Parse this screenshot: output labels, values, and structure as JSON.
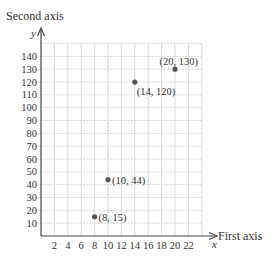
{
  "chart_data": {
    "type": "scatter",
    "title": "",
    "xlabel": "First axis",
    "ylabel": "Second axis",
    "x_var": "x",
    "y_var": "y",
    "xlim": [
      0,
      24
    ],
    "ylim": [
      0,
      150
    ],
    "x_ticks": [
      2,
      4,
      6,
      8,
      10,
      12,
      14,
      16,
      18,
      20,
      22
    ],
    "y_ticks": [
      10,
      20,
      30,
      40,
      50,
      60,
      70,
      80,
      90,
      100,
      110,
      120,
      130,
      140
    ],
    "grid": true,
    "points": [
      {
        "x": 8,
        "y": 15,
        "label": "(8, 15)",
        "label_pos": "right"
      },
      {
        "x": 10,
        "y": 44,
        "label": "(10, 44)",
        "label_pos": "right"
      },
      {
        "x": 14,
        "y": 120,
        "label": "(14, 120)",
        "label_pos": "below-right"
      },
      {
        "x": 20,
        "y": 130,
        "label": "(20, 130)",
        "label_pos": "above-left"
      }
    ],
    "colors": {
      "point": "#555555",
      "grid": "#cfcfcf",
      "axis": "#444444",
      "text": "#333333"
    }
  }
}
